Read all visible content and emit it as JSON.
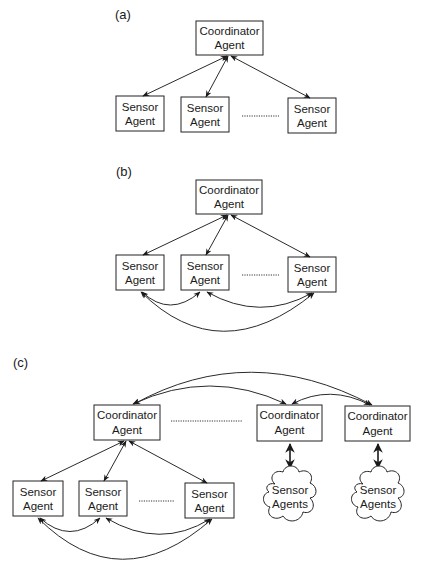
{
  "figure": {
    "panels": {
      "a": {
        "label": "(a)",
        "coordinator": {
          "line1": "Coordinator",
          "line2": "Agent"
        },
        "sensors": [
          {
            "line1": "Sensor",
            "line2": "Agent"
          },
          {
            "line1": "Sensor",
            "line2": "Agent"
          },
          {
            "line1": "Sensor",
            "line2": "Agent"
          }
        ]
      },
      "b": {
        "label": "(b)",
        "coordinator": {
          "line1": "Coordinator",
          "line2": "Agent"
        },
        "sensors": [
          {
            "line1": "Sensor",
            "line2": "Agent"
          },
          {
            "line1": "Sensor",
            "line2": "Agent"
          },
          {
            "line1": "Sensor",
            "line2": "Agent"
          }
        ]
      },
      "c": {
        "label": "(c)",
        "coordinators": [
          {
            "line1": "Coordinator",
            "line2": "Agent"
          },
          {
            "line1": "Coordinator",
            "line2": "Agent"
          },
          {
            "line1": "Coordinator",
            "line2": "Agent"
          }
        ],
        "sensors": [
          {
            "line1": "Sensor",
            "line2": "Agent"
          },
          {
            "line1": "Sensor",
            "line2": "Agent"
          },
          {
            "line1": "Sensor",
            "line2": "Agent"
          }
        ],
        "clouds": [
          {
            "line1": "Sensor",
            "line2": "Agents"
          },
          {
            "line1": "Sensor",
            "line2": "Agents"
          }
        ]
      }
    },
    "colors": {
      "stroke": "#222222",
      "background": "#ffffff"
    }
  }
}
